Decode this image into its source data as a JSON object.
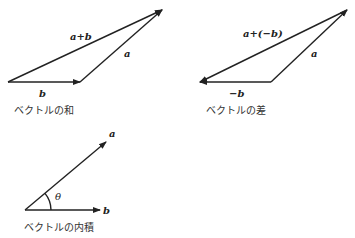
{
  "diagrams": [
    {
      "id": "sum",
      "caption": "ベクトルの和",
      "labels": {
        "sum": "a+b",
        "a": "a",
        "b": "b"
      }
    },
    {
      "id": "difference",
      "caption": "ベクトルの差",
      "labels": {
        "diff": "a+(−b)",
        "a": "a",
        "neg_b": "−b"
      }
    },
    {
      "id": "inner-product",
      "caption": "ベクトルの内積",
      "labels": {
        "a": "a",
        "b": "b",
        "angle": "θ"
      }
    }
  ],
  "colors": {
    "stroke": "#222222",
    "background": "#ffffff"
  }
}
